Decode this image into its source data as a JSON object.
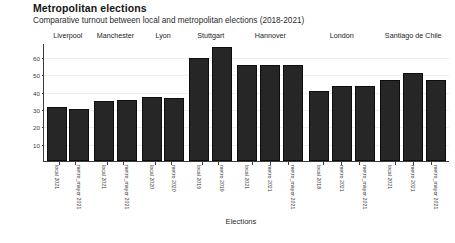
{
  "title": "Metropolitan elections",
  "subtitle": "Comparative turnout between local and metropolitan elections (2018-2021)",
  "chart_data": {
    "type": "bar",
    "title": "Metropolitan elections",
    "subtitle": "Comparative turnout between local and metropolitan elections (2018-2021)",
    "xlabel": "Elections",
    "ylabel": "% turnout",
    "ylim": [
      0,
      68
    ],
    "yticks": [
      10,
      20,
      30,
      40,
      50,
      60
    ],
    "grid": true,
    "legend": "none",
    "facet_variable": "city",
    "bar_color": "#262626",
    "facets": [
      {
        "label": "Liverpool",
        "categories": [
          "local 2021",
          "metro_mayor 2021"
        ],
        "values": [
          31,
          30
        ]
      },
      {
        "label": "Manchester",
        "categories": [
          "local 2021",
          "metro_mayor 2021"
        ],
        "values": [
          34.5,
          35
        ]
      },
      {
        "label": "Lyon",
        "categories": [
          "local 2020",
          "metro 2020"
        ],
        "values": [
          37,
          36.5
        ]
      },
      {
        "label": "Stuttgart",
        "categories": [
          "local 2019",
          "metro 2019"
        ],
        "values": [
          59.5,
          65.5
        ]
      },
      {
        "label": "Hannover",
        "categories": [
          "local 2021",
          "metro 2021",
          "metro_mayor 2021"
        ],
        "values": [
          55.5,
          55.5,
          55.5
        ]
      },
      {
        "label": "London",
        "categories": [
          "local 2018",
          "metro 2021",
          "metro_mayor 2021"
        ],
        "values": [
          40.5,
          43,
          43
        ]
      },
      {
        "label": "Santiago de Chile",
        "categories": [
          "local 2021",
          "metro 2021",
          "metro_mayor 2021"
        ],
        "values": [
          46.5,
          50.5,
          46.5
        ]
      }
    ]
  }
}
